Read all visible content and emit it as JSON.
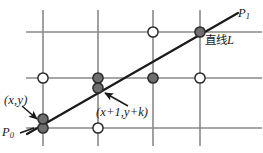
{
  "figure": {
    "colors": {
      "grid": "#8a8a8a",
      "line": "#1a1a1a",
      "filled_dot_fill": "#6e6e6e",
      "filled_dot_stroke": "#2b2b2b",
      "open_dot_fill": "#ffffff",
      "open_dot_stroke": "#2b2b2b",
      "text": "#1a1a1a",
      "background": "#ffffff"
    },
    "grid": {
      "vertical_x": [
        43,
        98,
        153,
        200
      ],
      "horizontal_y": [
        32,
        78,
        128
      ],
      "stroke_width": 1.6
    },
    "line_L": {
      "x1": 27,
      "y1": 134,
      "x2": 238,
      "y2": 13,
      "stroke_width": 2.2
    },
    "dots": [
      {
        "name": "grid-dot-open-r1c3",
        "x": 153,
        "y": 32,
        "style": "open"
      },
      {
        "name": "grid-dot-filled-r1c4",
        "x": 200,
        "y": 32,
        "style": "filled"
      },
      {
        "name": "grid-dot-open-r2c1",
        "x": 43,
        "y": 78,
        "style": "open"
      },
      {
        "name": "grid-dot-filled-r2c2",
        "x": 98,
        "y": 78,
        "style": "filled"
      },
      {
        "name": "grid-dot-filled-r2c3",
        "x": 153,
        "y": 78,
        "style": "filled"
      },
      {
        "name": "grid-dot-open-r2c4",
        "x": 200,
        "y": 78,
        "style": "open"
      },
      {
        "name": "grid-dot-filled-r3c1",
        "x": 43,
        "y": 128,
        "style": "filled"
      },
      {
        "name": "grid-dot-open-r3c2",
        "x": 98,
        "y": 128,
        "style": "open"
      },
      {
        "name": "line-dot-p0",
        "x": 43,
        "y": 119,
        "style": "filled"
      },
      {
        "name": "line-dot-next",
        "x": 98,
        "y": 88,
        "style": "filled"
      }
    ],
    "arrows": [
      {
        "name": "arrow-to-p0-point",
        "x1": 22,
        "y1": 106,
        "x2": 38,
        "y2": 120
      },
      {
        "name": "arrow-to-next-point",
        "x1": 127,
        "y1": 106,
        "x2": 104,
        "y2": 93
      },
      {
        "name": "leader-p0",
        "x1": 22,
        "y1": 132,
        "x2": 36,
        "y2": 128
      }
    ],
    "labels": {
      "current_point": "(x,y)",
      "p0": "P",
      "p0_sub": "0",
      "p1": "P",
      "p1_sub": "1",
      "next_point": "(x+1,y+k)",
      "line_cjk": "直线",
      "line_latin": "L"
    }
  }
}
